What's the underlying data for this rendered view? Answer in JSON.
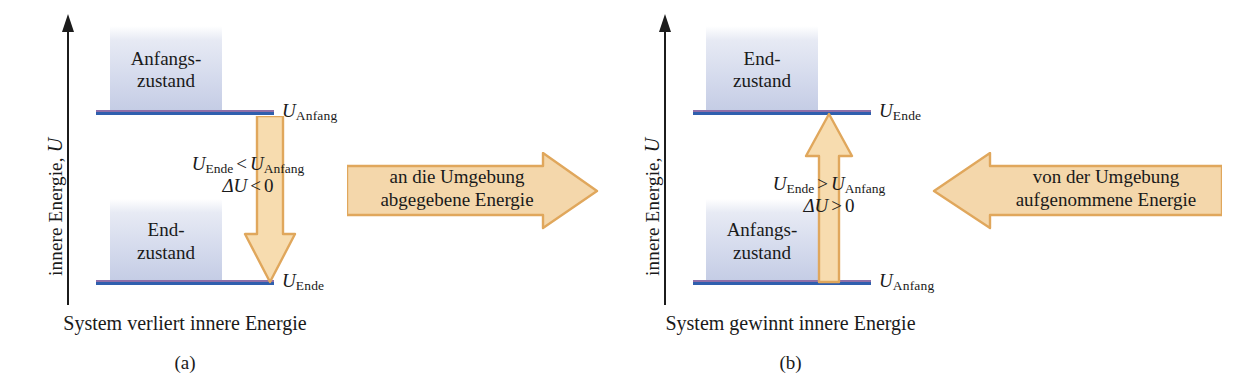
{
  "figure": {
    "axis_label_text": "innere Energie,",
    "axis_label_symbol": "U"
  },
  "panel_a": {
    "upper_state": {
      "line1": "Anfangs-",
      "line2": "zustand"
    },
    "lower_state": {
      "line1": "End-",
      "line2": "zustand"
    },
    "upper_level_label": {
      "symbol": "U",
      "subscript": "Anfang"
    },
    "lower_level_label": {
      "symbol": "U",
      "subscript": "Ende"
    },
    "inequality": {
      "left_symbol": "U",
      "left_sub": "Ende",
      "operator": "<",
      "right_symbol": "U",
      "right_sub": "Anfang"
    },
    "delta": {
      "symbol": "ΔU",
      "operator": "<",
      "value": "0"
    },
    "energy_arrow_text": {
      "line1": "an die Umgebung",
      "line2": "abgegebene Energie"
    },
    "arrow_direction_vertical": "down",
    "arrow_direction_horizontal": "right",
    "caption": "System verliert innere Energie",
    "sublabel": "(a)"
  },
  "panel_b": {
    "upper_state": {
      "line1": "End-",
      "line2": "zustand"
    },
    "lower_state": {
      "line1": "Anfangs-",
      "line2": "zustand"
    },
    "upper_level_label": {
      "symbol": "U",
      "subscript": "Ende"
    },
    "lower_level_label": {
      "symbol": "U",
      "subscript": "Anfang"
    },
    "inequality": {
      "left_symbol": "U",
      "left_sub": "Ende",
      "operator": ">",
      "right_symbol": "U",
      "right_sub": "Anfang"
    },
    "delta": {
      "symbol": "ΔU",
      "operator": ">",
      "value": "0"
    },
    "energy_arrow_text": {
      "line1": "von der Umgebung",
      "line2": "aufgenommene Energie"
    },
    "arrow_direction_vertical": "up",
    "arrow_direction_horizontal": "left",
    "caption": "System gewinnt innere Energie",
    "sublabel": "(b)"
  },
  "colors": {
    "level_line_blue": "#2f5fae",
    "level_line_violet": "#8f6fa8",
    "arrow_fill": "#f7dcaf",
    "arrow_stroke": "#e0a75c",
    "state_box_top": "#e7eaf4",
    "state_box_bottom": "#c3cbe4",
    "axis": "#1c1c1c",
    "background": "#ffffff"
  }
}
